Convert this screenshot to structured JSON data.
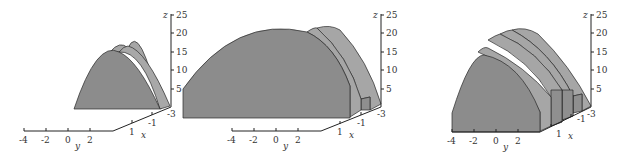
{
  "figure": {
    "colors": {
      "front_face": "#8c8c8c",
      "side_face": "#a6a6a6",
      "top_face": "#9a9a9a",
      "edge": "#2a2a2a",
      "axis": "#222222"
    },
    "panels": [
      {
        "id": "panel-1",
        "slabs": 1,
        "z_axis": {
          "label": "z",
          "ticks": [
            "5",
            "10",
            "15",
            "20",
            "25"
          ]
        },
        "y_axis": {
          "label": "y",
          "ticks": [
            "-4",
            "-2",
            "0",
            "2"
          ]
        },
        "x_axis": {
          "label": "x",
          "ticks": [
            "1",
            "-1",
            "-3"
          ]
        }
      },
      {
        "id": "panel-2",
        "slabs": 2,
        "z_axis": {
          "label": "z",
          "ticks": [
            "5",
            "10",
            "15",
            "20",
            "25"
          ]
        },
        "y_axis": {
          "label": "y",
          "ticks": [
            "-4",
            "-2",
            "0",
            "2"
          ]
        },
        "x_axis": {
          "label": "x",
          "ticks": [
            "1",
            "-1",
            "-3"
          ]
        }
      },
      {
        "id": "panel-3",
        "slabs": 4,
        "z_axis": {
          "label": "z",
          "ticks": [
            "5",
            "10",
            "15",
            "20",
            "25"
          ]
        },
        "y_axis": {
          "label": "y",
          "ticks": [
            "-4",
            "-2",
            "0",
            "2"
          ]
        },
        "x_axis": {
          "label": "x",
          "ticks": [
            "1",
            "-1",
            "-3"
          ]
        }
      }
    ]
  }
}
